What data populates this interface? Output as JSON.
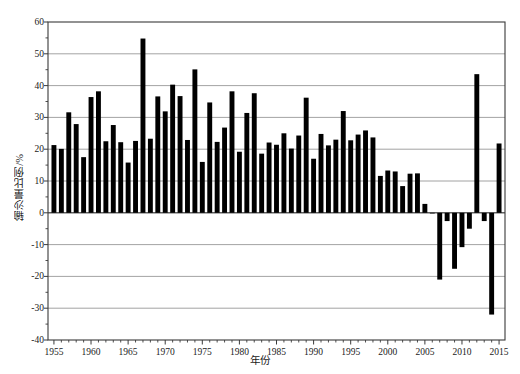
{
  "chart_data": {
    "type": "bar",
    "title": "",
    "xlabel": "年份",
    "ylabel": "输沙量比例/%",
    "xlim": [
      1954.2,
      2015.8
    ],
    "ylim": [
      -40,
      60
    ],
    "yticks": [
      60,
      50,
      40,
      30,
      20,
      10,
      0,
      -10,
      -20,
      -30,
      -40
    ],
    "ytick_labels": [
      "60",
      "50",
      "40",
      "30",
      "20",
      "10",
      "0",
      "-10",
      "-20",
      "-30",
      "-40"
    ],
    "xticks": [
      1955,
      1960,
      1965,
      1970,
      1975,
      1980,
      1985,
      1990,
      1995,
      2000,
      2005,
      2010,
      2015
    ],
    "xtick_labels": [
      "1955",
      "1960",
      "1965",
      "1970",
      "1975",
      "1980",
      "1985",
      "1990",
      "1995",
      "2000",
      "2005",
      "2010",
      "2015"
    ],
    "minor_xticks_every": 1,
    "grid": "horizontal",
    "legend": "none",
    "bar_color": "#000000",
    "categories": [
      1955,
      1956,
      1957,
      1958,
      1959,
      1960,
      1961,
      1962,
      1963,
      1964,
      1965,
      1966,
      1967,
      1968,
      1969,
      1970,
      1971,
      1972,
      1973,
      1974,
      1975,
      1976,
      1977,
      1978,
      1979,
      1980,
      1981,
      1982,
      1983,
      1984,
      1985,
      1986,
      1987,
      1988,
      1989,
      1990,
      1991,
      1992,
      1993,
      1994,
      1995,
      1996,
      1997,
      1998,
      1999,
      2000,
      2001,
      2002,
      2003,
      2004,
      2005,
      2006,
      2007,
      2008,
      2009,
      2010,
      2011,
      2012,
      2013,
      2014,
      2015
    ],
    "values": [
      21.3,
      20.1,
      31.6,
      27.9,
      17.5,
      36.4,
      38.2,
      22.5,
      27.6,
      22.2,
      15.8,
      22.6,
      54.8,
      23.3,
      36.6,
      31.9,
      40.3,
      36.7,
      22.9,
      45.1,
      16.0,
      34.7,
      22.3,
      26.8,
      38.2,
      19.2,
      31.4,
      37.6,
      18.6,
      22.1,
      21.4,
      25.0,
      20.2,
      24.3,
      36.2,
      17.0,
      24.8,
      21.2,
      23.0,
      32.0,
      22.8,
      24.6,
      25.9,
      23.7,
      11.6,
      13.3,
      13.0,
      8.4,
      12.3,
      12.4,
      2.8,
      -0.2,
      -21.0,
      -2.6,
      -17.6,
      -10.8,
      -5.0,
      43.6,
      -2.6,
      -32.0,
      21.8
    ]
  },
  "axis": {
    "ylabel_text": "输沙量比例/%",
    "xlabel_text": "年份"
  }
}
